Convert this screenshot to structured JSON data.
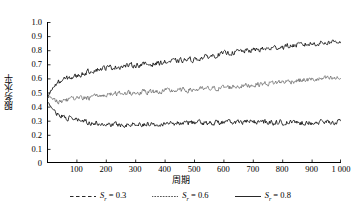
{
  "chart_data": {
    "type": "line",
    "title": "",
    "xlabel": "周期",
    "ylabel": "服务水平",
    "xlim": [
      0,
      1000
    ],
    "ylim": [
      0,
      1.0
    ],
    "grid": false,
    "legend_position": "below",
    "xticks": [
      0,
      100,
      200,
      300,
      400,
      500,
      600,
      700,
      800,
      900,
      1000
    ],
    "xtick_labels": [
      "",
      "100",
      "200",
      "300",
      "400",
      "500",
      "600",
      "700",
      "800",
      "900",
      "1 000"
    ],
    "yticks": [
      0,
      0.1,
      0.2,
      0.3,
      0.4,
      0.5,
      0.6,
      0.7,
      0.8,
      0.9,
      1.0
    ],
    "ytick_labels": [
      "0",
      "0.1",
      "0.2",
      "0.3",
      "0.4",
      "0.5",
      "0.6",
      "0.7",
      "0.8",
      "0.9",
      "1.0"
    ],
    "noise_amplitude": 0.016,
    "series": [
      {
        "name": "S_r = 0.3",
        "label_base": "S",
        "label_sub": "r",
        "label_value": "= 0.3",
        "style": "dashed",
        "color": "#111111",
        "x": [
          0,
          10,
          20,
          30,
          40,
          50,
          70,
          100,
          150,
          200,
          250,
          300,
          350,
          400,
          450,
          500,
          550,
          600,
          650,
          700,
          750,
          800,
          850,
          900,
          950,
          1000
        ],
        "values": [
          0.44,
          0.41,
          0.38,
          0.36,
          0.345,
          0.335,
          0.32,
          0.305,
          0.285,
          0.275,
          0.272,
          0.275,
          0.278,
          0.282,
          0.285,
          0.288,
          0.286,
          0.288,
          0.29,
          0.292,
          0.29,
          0.288,
          0.286,
          0.288,
          0.29,
          0.292
        ]
      },
      {
        "name": "S_r = 0.6",
        "label_base": "S",
        "label_sub": "r",
        "label_value": "= 0.6",
        "style": "dotted",
        "color": "#555555",
        "x": [
          0,
          10,
          20,
          30,
          40,
          50,
          70,
          100,
          150,
          200,
          250,
          300,
          350,
          400,
          450,
          500,
          550,
          600,
          650,
          700,
          750,
          800,
          850,
          900,
          950,
          1000
        ],
        "values": [
          0.46,
          0.47,
          0.455,
          0.44,
          0.435,
          0.44,
          0.45,
          0.455,
          0.465,
          0.485,
          0.495,
          0.5,
          0.505,
          0.51,
          0.515,
          0.52,
          0.525,
          0.535,
          0.545,
          0.555,
          0.565,
          0.575,
          0.585,
          0.59,
          0.598,
          0.6
        ]
      },
      {
        "name": "S_r = 0.8",
        "label_base": "S",
        "label_sub": "r",
        "label_value": "= 0.8",
        "style": "solid",
        "color": "#111111",
        "x": [
          0,
          10,
          20,
          30,
          40,
          50,
          70,
          100,
          150,
          200,
          250,
          300,
          350,
          400,
          450,
          500,
          550,
          600,
          650,
          700,
          750,
          800,
          850,
          900,
          950,
          1000
        ],
        "values": [
          0.45,
          0.5,
          0.535,
          0.555,
          0.57,
          0.585,
          0.6,
          0.615,
          0.655,
          0.675,
          0.685,
          0.695,
          0.7,
          0.715,
          0.725,
          0.735,
          0.755,
          0.775,
          0.79,
          0.8,
          0.81,
          0.825,
          0.835,
          0.845,
          0.855,
          0.865
        ]
      }
    ]
  },
  "legend": {
    "entries": [
      {
        "swatch": "dashed-line-swatch",
        "text": "S",
        "sub": "r",
        "value": "= 0.3"
      },
      {
        "swatch": "dotted-line-swatch",
        "text": "S",
        "sub": "r",
        "value": "= 0.6"
      },
      {
        "swatch": "solid-line-swatch",
        "text": "S",
        "sub": "r",
        "value": "= 0.8"
      }
    ]
  }
}
